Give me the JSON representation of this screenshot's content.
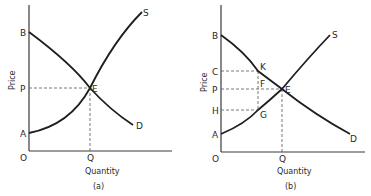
{
  "panels": [
    {
      "id": "a",
      "caption": "(a)",
      "x_axis_label": "Quantity",
      "y_axis_label": "Price",
      "origin_label": "O",
      "y_ticks": [
        "B",
        "P",
        "A"
      ],
      "x_ticks": [
        "Q"
      ],
      "curve_labels": {
        "supply": "S",
        "demand": "D"
      },
      "points": {
        "equilibrium": "E"
      }
    },
    {
      "id": "b",
      "caption": "(b)",
      "x_axis_label": "Quantity",
      "y_axis_label": "Price",
      "origin_label": "O",
      "y_ticks": [
        "B",
        "C",
        "P",
        "H",
        "A"
      ],
      "x_ticks": [
        "Q"
      ],
      "curve_labels": {
        "supply": "S",
        "demand": "D"
      },
      "points": {
        "equilibrium": "E",
        "demand_point": "K",
        "mid_point": "F",
        "supply_point": "G"
      }
    }
  ]
}
